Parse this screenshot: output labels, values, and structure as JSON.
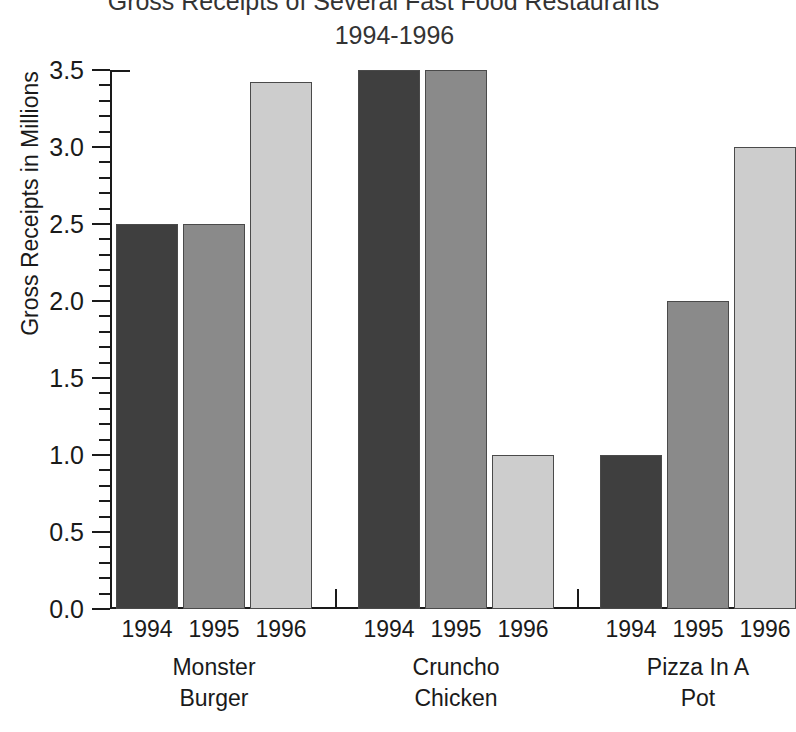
{
  "chart_data": {
    "type": "bar",
    "title": "Gross Receipts of Several Fast Food Restaurants",
    "subtitle": "1994-1996",
    "xlabel": "",
    "ylabel": "Gross Receipts in Millions",
    "ylim": [
      0.0,
      3.5
    ],
    "ytick_labels": [
      "0.0",
      "0.5",
      "1.0",
      "1.5",
      "2.0",
      "2.5",
      "3.0",
      "3.5"
    ],
    "ytick_values": [
      0.0,
      0.5,
      1.0,
      1.5,
      2.0,
      2.5,
      3.0,
      3.5
    ],
    "minor_tick_step": 0.1,
    "grid": false,
    "legend": "none",
    "categories": [
      "Monster Burger",
      "Cruncho Chicken",
      "Pizza In A Pot"
    ],
    "category_lines": [
      [
        "Monster",
        "Burger"
      ],
      [
        "Cruncho",
        "Chicken"
      ],
      [
        "Pizza In A",
        "Pot"
      ]
    ],
    "series": [
      {
        "name": "1994",
        "color": "#3f3f3f",
        "values": [
          2.5,
          3.5,
          1.0
        ]
      },
      {
        "name": "1995",
        "color": "#8a8a8a",
        "values": [
          2.5,
          3.5,
          2.0
        ]
      },
      {
        "name": "1996",
        "color": "#cdcdcd",
        "values": [
          3.42,
          1.0,
          3.0
        ]
      }
    ],
    "year_labels": [
      "1994",
      "1995",
      "1996"
    ],
    "bars": [
      {
        "group": "Monster Burger",
        "year": "1994",
        "value": 2.5,
        "color": "#3f3f3f"
      },
      {
        "group": "Monster Burger",
        "year": "1995",
        "value": 2.5,
        "color": "#8a8a8a"
      },
      {
        "group": "Monster Burger",
        "year": "1996",
        "value": 3.42,
        "color": "#cdcdcd"
      },
      {
        "group": "Cruncho Chicken",
        "year": "1994",
        "value": 3.5,
        "color": "#3f3f3f"
      },
      {
        "group": "Cruncho Chicken",
        "year": "1995",
        "value": 3.5,
        "color": "#8a8a8a"
      },
      {
        "group": "Cruncho Chicken",
        "year": "1996",
        "value": 1.0,
        "color": "#cdcdcd"
      },
      {
        "group": "Pizza In A Pot",
        "year": "1994",
        "value": 1.0,
        "color": "#3f3f3f"
      },
      {
        "group": "Pizza In A Pot",
        "year": "1995",
        "value": 2.0,
        "color": "#8a8a8a"
      },
      {
        "group": "Pizza In A Pot",
        "year": "1996",
        "value": 3.0,
        "color": "#cdcdcd"
      }
    ],
    "colors": {
      "axis": "#1a1a1a",
      "text": "#1a1a1a",
      "title": "#333333",
      "background": "#ffffff",
      "bar_1994": "#3f3f3f",
      "bar_1995": "#8a8a8a",
      "bar_1996": "#cdcdcd",
      "bar_border": "#4a4a4a"
    }
  }
}
